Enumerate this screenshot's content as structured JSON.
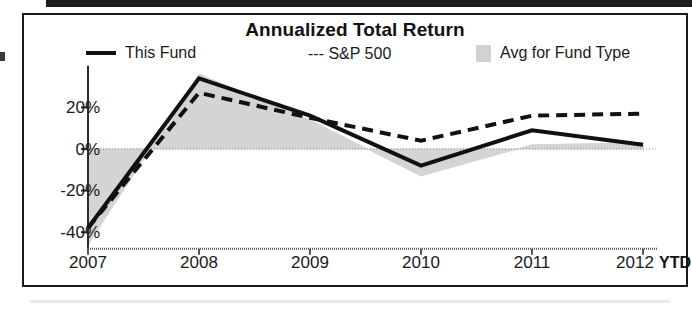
{
  "chart_data": {
    "type": "line",
    "title": "Annualized Total Return",
    "xlabel": "",
    "ylabel": "",
    "categories": [
      "2007",
      "2008",
      "2009",
      "2010",
      "2011",
      "2012"
    ],
    "x_axis_note": "YTD",
    "ytick_labels": [
      "20%",
      "0%",
      "-20%",
      "-40%"
    ],
    "yticks": [
      20,
      0,
      -20,
      -40
    ],
    "ylim": [
      -48,
      40
    ],
    "grid": false,
    "zero_line": true,
    "legend_position": "top",
    "series": [
      {
        "name": "This Fund",
        "style": "solid",
        "color": "#111111",
        "values": [
          -38,
          34,
          16,
          -8,
          9,
          2
        ]
      },
      {
        "name": "S&P 500",
        "style": "dashed",
        "color": "#111111",
        "values": [
          -38,
          27,
          15,
          4,
          16,
          17
        ]
      },
      {
        "name": "Avg for Fund Type",
        "style": "shaded-area",
        "color": "#d2d2d2",
        "values": [
          -46,
          36,
          14,
          -13,
          2,
          3
        ]
      }
    ]
  },
  "chart": {
    "title": "Annualized Total Return",
    "legend": [
      {
        "label": "This Fund",
        "icon": "solid-line-swatch"
      },
      {
        "label": "--- S&P 500",
        "icon": "dashed-line-swatch"
      },
      {
        "label": "Avg for Fund Type",
        "icon": "gray-square-swatch"
      }
    ],
    "y_labels": [
      "20%",
      "0%",
      "-20%",
      "-40%"
    ],
    "x_labels": [
      "2007",
      "2008",
      "2009",
      "2010",
      "2011",
      "2012"
    ],
    "ytd": "YTD"
  },
  "colors": {
    "line": "#111111",
    "band": "#d2d2d2",
    "border": "#1a1a1a",
    "background": "#ffffff"
  }
}
